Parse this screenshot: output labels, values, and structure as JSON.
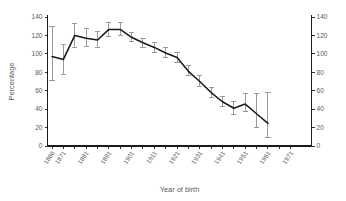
{
  "chart_data": {
    "type": "line",
    "title": "",
    "subtitle": "",
    "xlabel": "Year of birth",
    "ylabel": "Percentage",
    "grid": false,
    "legend": null,
    "xlim": [
      1864,
      1974
    ],
    "ylim": [
      0,
      140
    ],
    "y_ticks": [
      0,
      20,
      40,
      60,
      80,
      100,
      120,
      140
    ],
    "y_ticks_right": [
      0,
      20,
      40,
      60,
      80,
      100,
      120,
      140
    ],
    "x_ticks": [
      1866,
      1871,
      1876,
      1881,
      1886,
      1891,
      1896,
      1901,
      1906,
      1911,
      1916,
      1921,
      1926,
      1931,
      1936,
      1941,
      1946,
      1951,
      1956,
      1961,
      1966,
      1971
    ],
    "x_tick_labels": [
      "1866",
      "1871",
      "",
      "1881",
      "",
      "1891",
      "",
      "1901",
      "",
      "1911",
      "",
      "1921",
      "",
      "1931",
      "",
      "1941",
      "",
      "1951",
      "",
      "1961",
      "",
      "1971"
    ],
    "x": [
      1866,
      1871,
      1876,
      1881,
      1886,
      1891,
      1896,
      1901,
      1906,
      1911,
      1916,
      1921,
      1926,
      1931,
      1936,
      1941,
      1946,
      1951,
      1956,
      1961
    ],
    "values": [
      97,
      94,
      120,
      117,
      115,
      126.5,
      126.5,
      118,
      112,
      107,
      101,
      96,
      81,
      70,
      58,
      48,
      41,
      45.5,
      35,
      24.5
    ],
    "error_low": [
      71,
      78,
      107,
      108,
      107,
      119,
      120,
      113,
      107,
      102,
      96,
      91,
      76,
      65,
      53,
      43,
      34,
      37,
      20,
      9
    ],
    "error_high": [
      130,
      110,
      133,
      127,
      124,
      134,
      134,
      123,
      117,
      112,
      107,
      101,
      87,
      76,
      64,
      54,
      48,
      57,
      57,
      58
    ],
    "series": [
      {
        "name": "Percentage",
        "values": [
          97,
          94,
          120,
          117,
          115,
          126.5,
          126.5,
          118,
          112,
          107,
          101,
          96,
          81,
          70,
          58,
          48,
          41,
          45.5,
          35,
          24.5
        ]
      }
    ],
    "colors": {
      "line": "#1a1a1a",
      "error_bar": "#8a8a8a",
      "axis": "#1a1a1a",
      "text": "#5a5a5a",
      "background": "#ffffff"
    }
  }
}
